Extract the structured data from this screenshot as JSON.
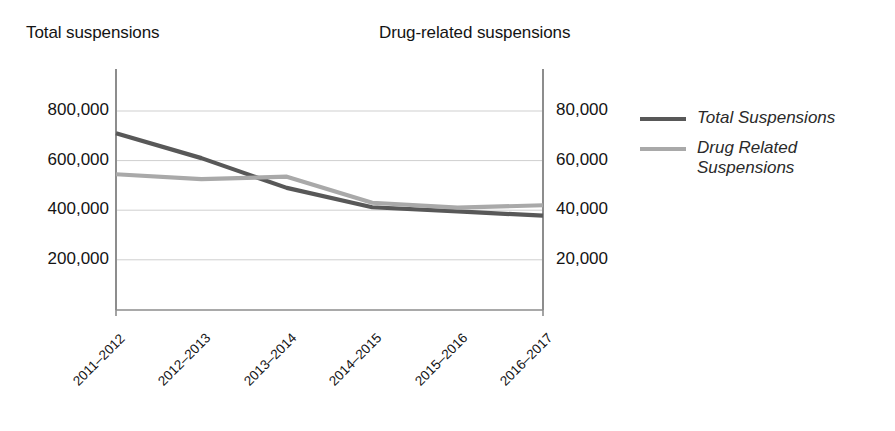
{
  "chart_data": {
    "type": "line",
    "title": "",
    "xlabel": "",
    "categories": [
      "2011–2012",
      "2012–2013",
      "2013–2014",
      "2014–2015",
      "2015–2016",
      "2016–2017"
    ],
    "grid": true,
    "legend_position": "right",
    "axes": {
      "left": {
        "title": "Total suspensions",
        "ticks": [
          "200,000",
          "400,000",
          "600,000",
          "800,000"
        ],
        "tick_values": [
          200000,
          400000,
          600000,
          800000
        ],
        "ylim": [
          0,
          900000
        ]
      },
      "right": {
        "title": "Drug-related suspensions",
        "ticks": [
          "20,000",
          "40,000",
          "60,000",
          "80,000"
        ],
        "tick_values": [
          20000,
          40000,
          60000,
          80000
        ],
        "ylim": [
          0,
          90000
        ]
      }
    },
    "series": [
      {
        "name": "Total Suspensions",
        "axis": "left",
        "color": "#585858",
        "values": [
          710000,
          610000,
          490000,
          412000,
          395000,
          378000
        ]
      },
      {
        "name": "Drug Related Suspensions",
        "axis": "right",
        "color": "#a9a9a9",
        "values": [
          54500,
          52500,
          53500,
          43000,
          41000,
          42000
        ]
      }
    ]
  },
  "legend": {
    "items": [
      {
        "label": "Total Suspensions",
        "color": "#585858"
      },
      {
        "label": "Drug Related\nSuspensions",
        "color": "#a9a9a9"
      }
    ]
  },
  "colors": {
    "total_line": "#585858",
    "drug_line": "#a9a9a9",
    "axis": "#8d8d8d",
    "gridline": "#cfcfcf",
    "text": "#141414",
    "background": "#ffffff"
  }
}
